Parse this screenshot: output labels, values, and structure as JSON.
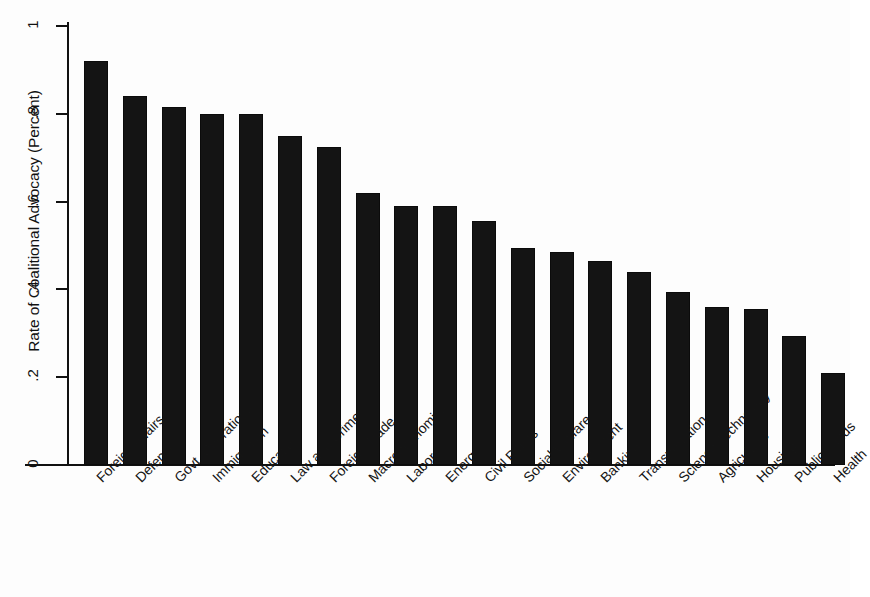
{
  "chart_data": {
    "type": "bar",
    "title": "",
    "subtitle": "",
    "xlabel": "",
    "ylabel": "Rate of Coalitional Advocacy (Percent)",
    "ylim": [
      0,
      1
    ],
    "yticks": [
      0,
      0.2,
      0.4,
      0.6,
      0.8,
      1
    ],
    "ytick_labels": [
      "0",
      ".2",
      ".4",
      ".6",
      ".8",
      "1"
    ],
    "grid": false,
    "legend": null,
    "bar_color": "#141414",
    "background_color": "#fdfdfd",
    "categories": [
      "Foreign Affairs",
      "Defense",
      "Govt. Operations",
      "Immigration",
      "Education",
      "Law and Crime",
      "Foreign Trade",
      "Macroeconomics",
      "Labor",
      "Energy",
      "Civil Rights",
      "Social Welfare",
      "Environment",
      "Banking",
      "Transportation",
      "Science/Technology",
      "Agriculture",
      "Housing",
      "Public Lands",
      "Health"
    ],
    "values": [
      0.92,
      0.84,
      0.815,
      0.8,
      0.8,
      0.75,
      0.725,
      0.62,
      0.59,
      0.59,
      0.555,
      0.495,
      0.485,
      0.465,
      0.44,
      0.395,
      0.36,
      0.355,
      0.293,
      0.21
    ]
  }
}
